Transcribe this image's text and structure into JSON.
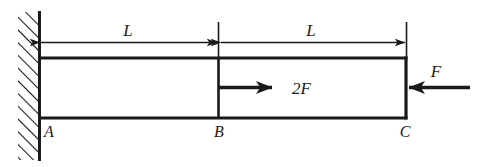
{
  "figure": {
    "type": "engineering-diagram",
    "background_color": "#ffffff",
    "line_color": "#1a1a1a",
    "support": {
      "kind": "fixed-wall",
      "hatch_name": "wall-hatching",
      "position": "left"
    },
    "beam": {
      "name": "beam-body",
      "segments": [
        {
          "from": "A",
          "to": "B",
          "length_label": "L"
        },
        {
          "from": "B",
          "to": "C",
          "length_label": "L"
        }
      ]
    },
    "nodes": [
      {
        "id": "A",
        "label": "A",
        "description": "fixed end at wall"
      },
      {
        "id": "B",
        "label": "B",
        "description": "section junction"
      },
      {
        "id": "C",
        "label": "C",
        "description": "free end"
      }
    ],
    "dimensions": [
      {
        "name": "dimension-left",
        "label": "L",
        "from": "A",
        "to": "B"
      },
      {
        "name": "dimension-right",
        "label": "L",
        "from": "B",
        "to": "C"
      }
    ],
    "forces": [
      {
        "name": "force-2F",
        "label": "2F",
        "direction": "right",
        "applied_at": "B"
      },
      {
        "name": "force-F",
        "label": "F",
        "direction": "left",
        "applied_at": "C"
      }
    ]
  }
}
